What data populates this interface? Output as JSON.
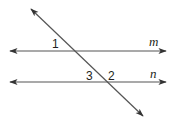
{
  "diagram": {
    "colors": {
      "line": "#444444",
      "text": "#231f20",
      "background": "#ffffff"
    },
    "lines": [
      {
        "id": "m",
        "label": "m",
        "from": [
          10,
          51
        ],
        "to": [
          166,
          51
        ],
        "arrows": "both"
      },
      {
        "id": "n",
        "label": "n",
        "from": [
          10,
          82
        ],
        "to": [
          166,
          82
        ],
        "arrows": "both"
      },
      {
        "id": "transversal",
        "label": "",
        "from": [
          31,
          9
        ],
        "to": [
          143,
          116
        ],
        "arrows": "both"
      }
    ],
    "angle_labels": [
      {
        "id": "angle-1",
        "text": "1",
        "x": 52,
        "y": 48
      },
      {
        "id": "angle-3",
        "text": "3",
        "x": 86,
        "y": 80
      },
      {
        "id": "angle-2",
        "text": "2",
        "x": 108,
        "y": 80
      }
    ],
    "line_labels": [
      {
        "id": "label-m",
        "text": "m",
        "x": 149,
        "y": 46
      },
      {
        "id": "label-n",
        "text": "n",
        "x": 150,
        "y": 78
      }
    ]
  }
}
